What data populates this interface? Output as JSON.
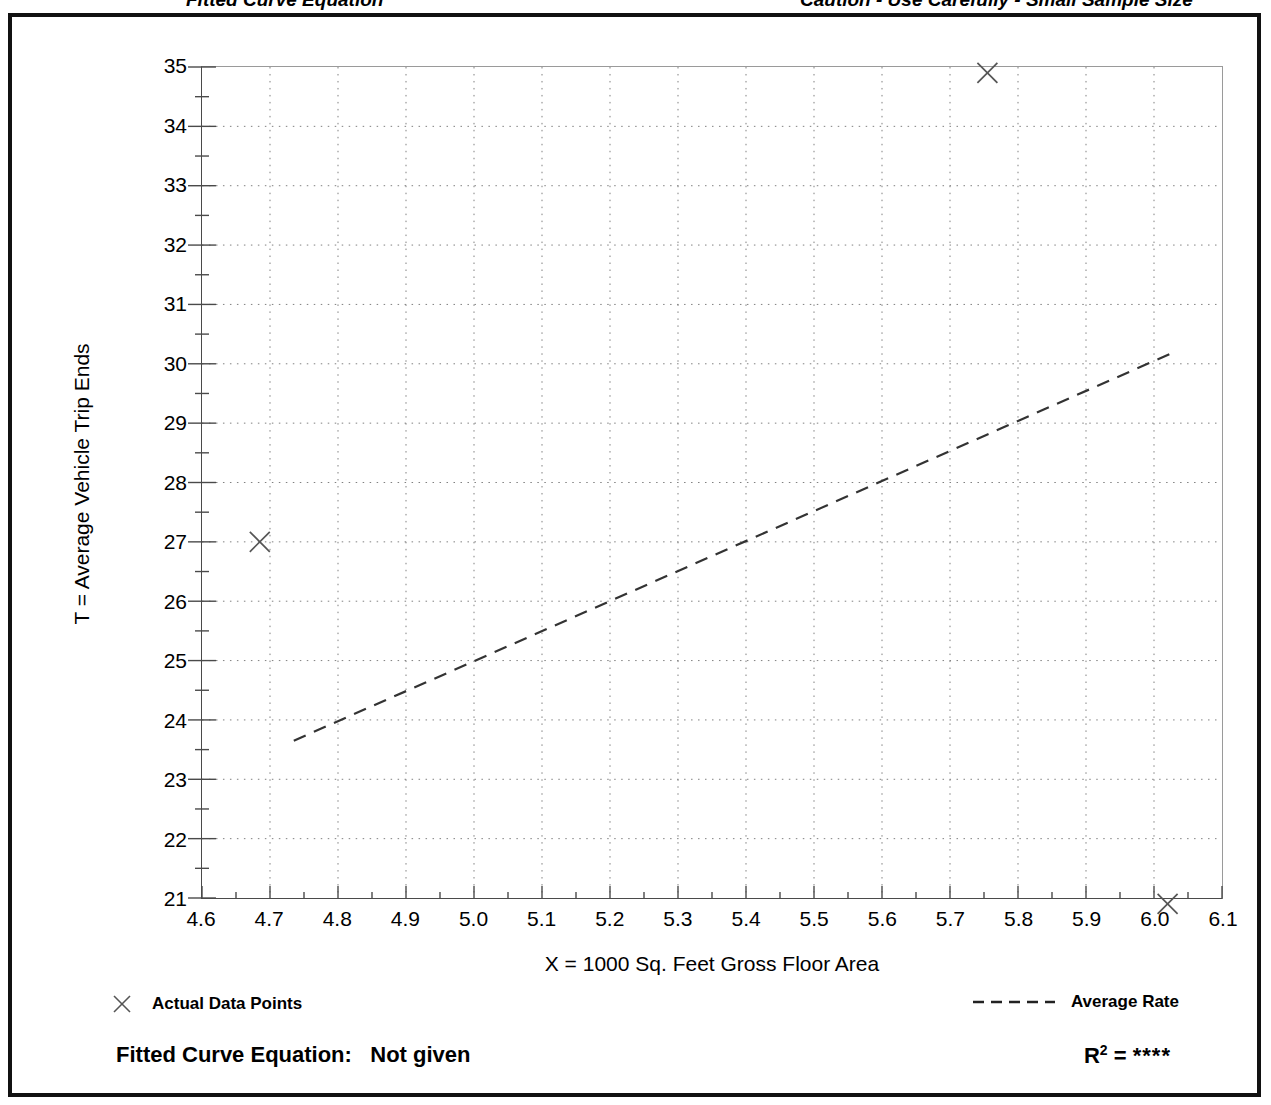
{
  "page_header": {
    "left_text": "Fitted Curve Equation",
    "right_text": "Caution - Use Carefully - Small Sample Size"
  },
  "axis_titles": {
    "x": "X = 1000 Sq. Feet Gross Floor Area",
    "y": "T = Average Vehicle Trip Ends"
  },
  "legend": {
    "data_points_label": "Actual Data Points",
    "average_rate_label": "Average Rate",
    "marker_icon": "cross-marker-icon",
    "line_icon": "dashed-line-icon"
  },
  "equation": {
    "label": "Fitted Curve Equation:",
    "value": "Not given",
    "r_label": "R",
    "r_exponent": "2",
    "r_equals": "=",
    "r_value": "****"
  },
  "colors": {
    "frame": "#111111",
    "axis": "#4a4a4a",
    "grid": "#808080",
    "marker": "#555555",
    "trend": "#333333",
    "background": "#ffffff"
  },
  "chart_data": {
    "type": "scatter",
    "title": "",
    "subtitle": "",
    "xlabel": "X = 1000 Sq. Feet Gross Floor Area",
    "ylabel": "T = Average Vehicle Trip Ends",
    "xlim": [
      4.6,
      6.1
    ],
    "ylim": [
      21,
      35
    ],
    "xticks": [
      4.6,
      4.7,
      4.8,
      4.9,
      5.0,
      5.1,
      5.2,
      5.3,
      5.4,
      5.5,
      5.6,
      5.7,
      5.8,
      5.9,
      6.0,
      6.1
    ],
    "xtick_labels": [
      "4.6",
      "4.7",
      "4.8",
      "4.9",
      "5.0",
      "5.1",
      "5.2",
      "5.3",
      "5.4",
      "5.5",
      "5.6",
      "5.7",
      "5.8",
      "5.9",
      "6.0",
      "6.1"
    ],
    "yticks": [
      21,
      22,
      23,
      24,
      25,
      26,
      27,
      28,
      29,
      30,
      31,
      32,
      33,
      34,
      35
    ],
    "ytick_labels": [
      "21",
      "22",
      "23",
      "24",
      "25",
      "26",
      "27",
      "28",
      "29",
      "30",
      "31",
      "32",
      "33",
      "34",
      "35"
    ],
    "x_minor_tick_step": 0.05,
    "y_minor_tick_step": 0.5,
    "grid": true,
    "grid_style": "dotted",
    "legend_position": "below-plot",
    "series": [
      {
        "name": "Actual Data Points",
        "type": "scatter",
        "marker": "x",
        "points": [
          {
            "x": 4.685,
            "y": 27.0
          },
          {
            "x": 5.755,
            "y": 34.9
          },
          {
            "x": 6.02,
            "y": 20.9
          }
        ]
      },
      {
        "name": "Average Rate",
        "type": "line",
        "style": "dashed",
        "points": [
          {
            "x": 4.735,
            "y": 23.65
          },
          {
            "x": 6.03,
            "y": 30.2
          }
        ]
      }
    ]
  }
}
